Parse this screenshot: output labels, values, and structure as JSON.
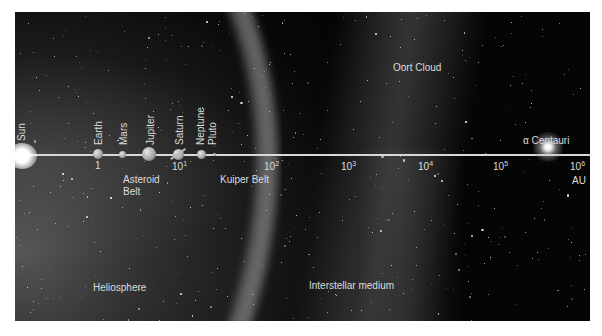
{
  "diagram": {
    "colors": {
      "background": "#050505",
      "axis": "#d8d8d8",
      "label": "#dcdcdc",
      "page": "#ffffff"
    },
    "sun": {
      "label": "Sun"
    },
    "planets": [
      {
        "name": "Earth",
        "label": "Earth"
      },
      {
        "name": "Mars",
        "label": "Mars"
      },
      {
        "name": "Jupiter",
        "label": "Jupiter"
      },
      {
        "name": "Saturn",
        "label": "Saturn"
      },
      {
        "name": "Neptune",
        "label": "Neptune"
      },
      {
        "name": "Pluto",
        "label": "Pluto"
      }
    ],
    "axis": {
      "unit": "AU",
      "ticks": [
        {
          "base": "1",
          "exp": ""
        },
        {
          "base": "10",
          "exp": "1"
        },
        {
          "base": "10",
          "exp": "2"
        },
        {
          "base": "10",
          "exp": "3"
        },
        {
          "base": "10",
          "exp": "4"
        },
        {
          "base": "10",
          "exp": "5"
        },
        {
          "base": "10",
          "exp": "6"
        }
      ]
    },
    "regions": {
      "asteroid_belt_line1": "Asteroid",
      "asteroid_belt_line2": "Belt",
      "kuiper_belt": "Kuiper Belt",
      "oort_cloud": "Oort Cloud",
      "heliosphere": "Heliosphere",
      "interstellar_medium": "Interstellar medium"
    },
    "alpha_centauri": {
      "label": "α Centauri"
    }
  }
}
